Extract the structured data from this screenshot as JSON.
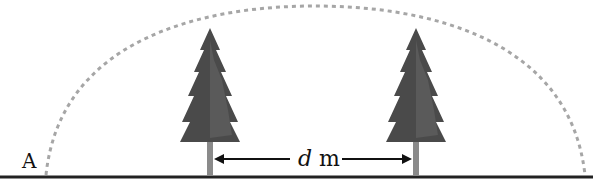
{
  "diagram": {
    "point_label": "A",
    "distance_label": {
      "variable": "d",
      "unit": "m"
    },
    "colors": {
      "ground": "#222222",
      "arc": "#a6a6a6",
      "tree_foliage": "#4a4a4a",
      "tree_trunk": "#777777",
      "arrow": "#111111"
    },
    "trees": [
      {
        "name": "left-tree",
        "trunk_x": 210
      },
      {
        "name": "right-tree",
        "trunk_x": 416
      }
    ]
  }
}
